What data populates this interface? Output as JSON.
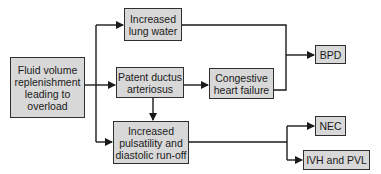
{
  "diagram": {
    "type": "flowchart",
    "nodes": {
      "fluid": {
        "label": "Fluid volume\nreplenishment\nleading to\noverload"
      },
      "lung": {
        "label": "Increased\nlung water"
      },
      "pda": {
        "label": "Patent ductus\narteriosus"
      },
      "chf": {
        "label": "Congestive\nheart failure"
      },
      "puls": {
        "label": "Increased\npulsatility and\ndiastolic run-off"
      },
      "bpd": {
        "label": "BPD"
      },
      "nec": {
        "label": "NEC"
      },
      "ivh": {
        "label": "IVH and PVL"
      }
    },
    "edges": [
      {
        "from": "fluid",
        "to": "lung"
      },
      {
        "from": "fluid",
        "to": "pda"
      },
      {
        "from": "fluid",
        "to": "puls"
      },
      {
        "from": "pda",
        "to": "chf"
      },
      {
        "from": "pda",
        "to": "puls"
      },
      {
        "from": "lung",
        "to": "bpd"
      },
      {
        "from": "chf",
        "to": "bpd"
      },
      {
        "from": "puls",
        "to": "nec"
      },
      {
        "from": "puls",
        "to": "ivh"
      }
    ],
    "colors": {
      "box_fill": "#d8d8d8",
      "line": "#1a1a1a"
    }
  }
}
